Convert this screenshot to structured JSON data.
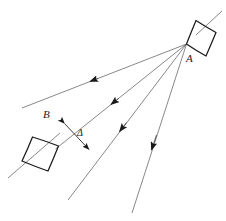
{
  "figure": {
    "type": "geometric-ray-diagram",
    "background_color": "#ffffff",
    "stroke_color": "#2b2b2b",
    "line_color": "#555555",
    "canvas": {
      "width": 226,
      "height": 221
    },
    "labels": {
      "a": "A",
      "b": "B",
      "delta": "Δ"
    },
    "label_positions": {
      "a": {
        "x": 186,
        "y": 53
      },
      "b": {
        "x": 43,
        "y": 109
      },
      "delta": {
        "x": 77,
        "y": 128
      }
    },
    "shape_a": {
      "name": "body-a-quadrilateral",
      "points": "186.5,44 196,20.5 216,32.5 206,56",
      "convergence_point": {
        "x": 186.5,
        "y": 44
      }
    },
    "shape_b": {
      "name": "body-b-quadrilateral",
      "points": "58.5,146 32.5,137 22,161 48,171"
    },
    "rays": [
      {
        "name": "ray-1",
        "x1": 186.5,
        "y1": 44,
        "x2": 22,
        "y2": 108,
        "arrow_t": 0.58
      },
      {
        "name": "ray-2",
        "x1": 186.5,
        "y1": 44,
        "x2": 55.5,
        "y2": 149,
        "arrow_t": 0.56
      },
      {
        "name": "ray-3",
        "x1": 186.5,
        "y1": 44,
        "x2": 68,
        "y2": 200,
        "arrow_t": 0.58
      },
      {
        "name": "ray-4",
        "x1": 186.5,
        "y1": 44,
        "x2": 132,
        "y2": 213,
        "arrow_t": 0.57
      }
    ],
    "axis_line_a": {
      "name": "axis-through-a",
      "x1": 196,
      "y1": 35,
      "x2": 222,
      "y2": 11
    },
    "axis_line_b": {
      "name": "axis-through-b",
      "x1": 60,
      "y1": 133,
      "x2": 8,
      "y2": 178
    },
    "delta_segment": {
      "name": "delta-measure-arrow",
      "x1": 64.5,
      "y1": 123.5,
      "x2": 89,
      "y2": 149.5,
      "double_headed": true
    }
  }
}
